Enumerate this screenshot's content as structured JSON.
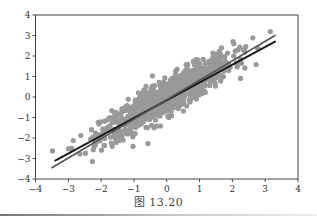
{
  "caption": "图 13.20",
  "chart_data": {
    "type": "scatter",
    "title": "",
    "xlabel": "",
    "ylabel": "",
    "xlim": [
      -4,
      4
    ],
    "ylim": [
      -4,
      4
    ],
    "grid": false,
    "xticks": [
      -4,
      -3,
      -2,
      -1,
      0,
      1,
      2,
      3,
      4
    ],
    "yticks": [
      -4,
      -3,
      -2,
      -1,
      0,
      1,
      2,
      3,
      4
    ],
    "xtick_labels": [
      "−4",
      "−3",
      "−2",
      "−1",
      "0",
      "1",
      "2",
      "3",
      "4"
    ],
    "ytick_labels": [
      "−4",
      "−3",
      "−2",
      "−1",
      "0",
      "1",
      "2",
      "3",
      "4"
    ],
    "scatter": {
      "description": "Correlated bivariate normal sample, approx. 1000 points, strong positive correlation (~0.9)",
      "n_points": 1000,
      "mean": [
        0,
        0
      ],
      "std": [
        1,
        1
      ],
      "correlation": 0.9,
      "color": "#999999",
      "marker_radius": 2.6
    },
    "lines": [
      {
        "name": "fit-line-dark",
        "x": [
          -3.4,
          3.3
        ],
        "y": [
          -3.1,
          2.7
        ],
        "color": "#1a1a1a",
        "width": 2
      },
      {
        "name": "fit-line-light",
        "x": [
          -3.5,
          3.3
        ],
        "y": [
          -3.45,
          3.0
        ],
        "color": "#555555",
        "width": 1.6
      }
    ]
  },
  "colors": {
    "axis": "#444444",
    "points": "#999999"
  }
}
